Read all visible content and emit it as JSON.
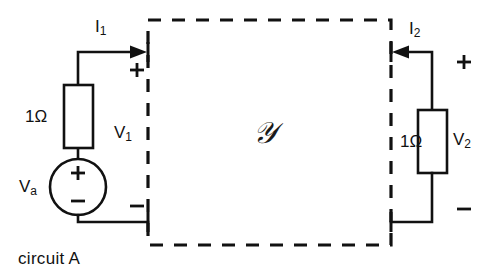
{
  "diagram": {
    "caption": "circuit A",
    "network_symbol": "𝒴",
    "stroke_color": "#111111",
    "background_color": "#ffffff",
    "left_port": {
      "current_label": "I",
      "current_subscript": "1",
      "current_direction": "into-network",
      "voltage_label": "V",
      "voltage_subscript": "1",
      "polarity_top": "+",
      "polarity_bottom": "−",
      "resistor_label": "1Ω",
      "source_label": "V",
      "source_subscript": "a",
      "source_polarity_top": "+",
      "source_polarity_bottom": "−"
    },
    "right_port": {
      "current_label": "I",
      "current_subscript": "2",
      "current_direction": "into-network",
      "voltage_label": "V",
      "voltage_subscript": "2",
      "polarity_top": "+",
      "polarity_bottom": "−",
      "resistor_label": "1Ω"
    }
  }
}
